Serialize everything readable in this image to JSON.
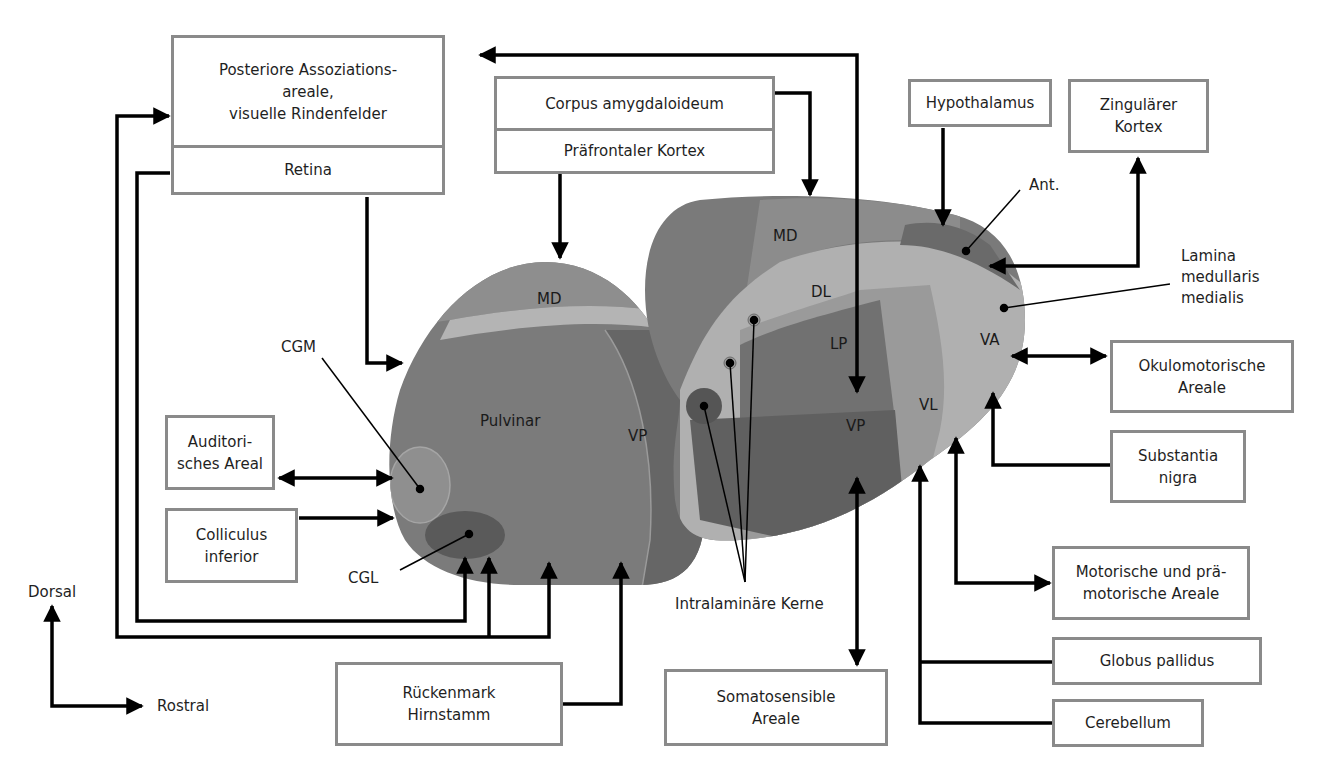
{
  "diagram": {
    "title_visible": false,
    "boxes": {
      "posterior_association": "Posteriore Assoziations-\nareale,\nvisuelle Rindenfelder",
      "retina": "Retina",
      "amygdala": "Corpus amygdaloideum",
      "prefrontal": "Präfrontaler Kortex",
      "hypothalamus": "Hypothalamus",
      "cingulate": "Zingulärer\nKortex",
      "auditory": "Auditori-\nsches Areal",
      "colliculus": "Colliculus\ninferior",
      "spinal_cord": "Rückenmark\nHirnstamm",
      "somatosensory": "Somatosensible\nAreale",
      "oculomotor": "Okulomotorische\nAreale",
      "substantia_nigra": "Substantia\nnigra",
      "motor": "Motorische und prä-\nmotorische Areale",
      "globus_pallidus": "Globus pallidus",
      "cerebellum": "Cerebellum"
    },
    "annotations": {
      "cgm": "CGM",
      "cgl": "CGL",
      "anterior": "Ant.",
      "lamina": "Lamina\nmedullaris\nmedialis",
      "intralaminar": "Intralaminäre Kerne",
      "dorsal": "Dorsal",
      "rostral": "Rostral"
    },
    "nuclei_left": {
      "md": "MD",
      "pulvinar": "Pulvinar",
      "vp": "VP"
    },
    "nuclei_right": {
      "md": "MD",
      "dl": "DL",
      "lp": "LP",
      "vp": "VP",
      "vl": "VL",
      "va": "VA"
    },
    "colors": {
      "box_border": "#8a8a8a",
      "arrow": "#000000",
      "pulvinar": "#7b7b7b",
      "md_light": "#8e8e8e",
      "lamina": "#b4b4b4",
      "vp_dark": "#5e5e5e",
      "vl": "#9a9a9a",
      "cgl": "#5a5a5a",
      "ant": "#6a6a6a"
    }
  }
}
